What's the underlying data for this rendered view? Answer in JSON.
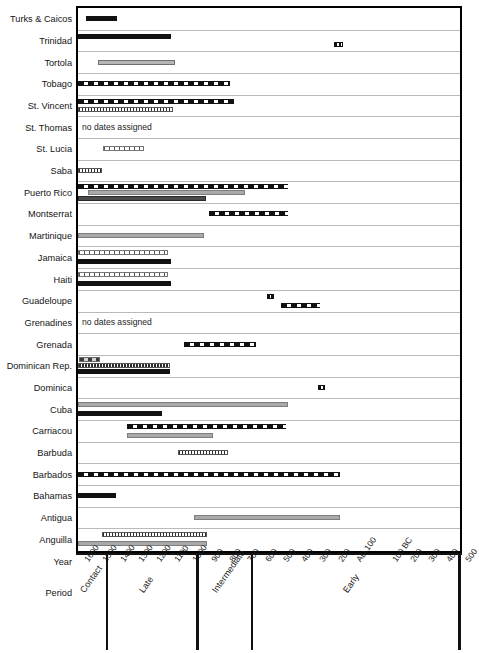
{
  "chart_data": {
    "type": "bar",
    "chart_kind": "horizontal-range-bar-timeline",
    "title": "",
    "xlabel": "Year",
    "ylabel": "",
    "grid": true,
    "legend": false,
    "x_axis": {
      "name": "Year",
      "direction": "decreasing-left-to-right (AD years then BC)",
      "ticks": [
        "1600",
        "1500",
        "1400",
        "1300",
        "1200",
        "1100",
        "1000",
        "900",
        "800",
        "700",
        "600",
        "500",
        "400",
        "300",
        "200",
        "AD 100",
        "100 BC",
        "200",
        "300",
        "400",
        "500"
      ],
      "xlim_label_left": "1600",
      "xlim_label_right": "500"
    },
    "period_axis": {
      "name": "Period",
      "periods": [
        "Contact",
        "Late",
        "Intermediate",
        "Early"
      ]
    },
    "no_data_note": "no dates assigned",
    "categories": [
      "Turks & Caicos",
      "Trinidad",
      "Tortola",
      "Tobago",
      "St. Vincent",
      "St. Thomas",
      "St. Lucia",
      "Saba",
      "Puerto Rico",
      "Montserrat",
      "Martinique",
      "Jamaica",
      "Haiti",
      "Guadeloupe",
      "Grenadines",
      "Grenada",
      "Dominican Rep.",
      "Dominica",
      "Cuba",
      "Carriacou",
      "Barbuda",
      "Barbados",
      "Bahamas",
      "Antigua",
      "Anguilla"
    ],
    "rows": [
      {
        "label": "Turks & Caicos",
        "no_dates": false,
        "bars": [
          {
            "start": 1555,
            "end": 1385,
            "style": "solid-black"
          }
        ]
      },
      {
        "label": "Trinidad",
        "no_dates": false,
        "bars": [
          {
            "start": 1600,
            "end": 1090,
            "style": "solid-black"
          },
          {
            "start": 190,
            "end": 140,
            "style": "marker"
          }
        ]
      },
      {
        "label": "Tortola",
        "no_dates": false,
        "bars": [
          {
            "start": 1490,
            "end": 1065,
            "style": "grey-fill"
          }
        ]
      },
      {
        "label": "Tobago",
        "no_dates": false,
        "bars": [
          {
            "start": 1600,
            "end": 760,
            "style": "dash-big"
          }
        ]
      },
      {
        "label": "St. Vincent",
        "no_dates": false,
        "bars": [
          {
            "start": 1600,
            "end": 740,
            "style": "dash-big"
          },
          {
            "start": 1600,
            "end": 1075,
            "style": "speckle"
          }
        ]
      },
      {
        "label": "St. Thomas",
        "no_dates": true,
        "bars": []
      },
      {
        "label": "St. Lucia",
        "no_dates": false,
        "bars": [
          {
            "start": 1460,
            "end": 1235,
            "style": "hatch-fine"
          }
        ]
      },
      {
        "label": "Saba",
        "no_dates": false,
        "bars": [
          {
            "start": 1600,
            "end": 1470,
            "style": "speckle"
          }
        ]
      },
      {
        "label": "Puerto Rico",
        "no_dates": false,
        "bars": [
          {
            "start": 1600,
            "end": 440,
            "style": "dash-big"
          },
          {
            "start": 1545,
            "end": 680,
            "style": "grey-plain"
          },
          {
            "start": 1600,
            "end": 895,
            "style": "dark-grey"
          }
        ]
      },
      {
        "label": "Montserrat",
        "no_dates": false,
        "bars": [
          {
            "start": 880,
            "end": 440,
            "style": "dash-big"
          }
        ]
      },
      {
        "label": "Martinique",
        "no_dates": false,
        "bars": [
          {
            "start": 1600,
            "end": 905,
            "style": "grey-plain"
          }
        ]
      },
      {
        "label": "Jamaica",
        "no_dates": false,
        "bars": [
          {
            "start": 1600,
            "end": 1105,
            "style": "hatch-fine"
          },
          {
            "start": 1600,
            "end": 1085,
            "style": "solid-black"
          }
        ]
      },
      {
        "label": "Haiti",
        "no_dates": false,
        "bars": [
          {
            "start": 1600,
            "end": 1105,
            "style": "hatch-fine"
          },
          {
            "start": 1600,
            "end": 1085,
            "style": "solid-black"
          }
        ]
      },
      {
        "label": "Guadeloupe",
        "no_dates": false,
        "bars": [
          {
            "start": 560,
            "end": 520,
            "style": "marker"
          },
          {
            "start": 480,
            "end": 265,
            "style": "dash-big"
          }
        ]
      },
      {
        "label": "Grenadines",
        "no_dates": true,
        "bars": []
      },
      {
        "label": "Grenada",
        "no_dates": false,
        "bars": [
          {
            "start": 1015,
            "end": 620,
            "style": "dash-big"
          }
        ]
      },
      {
        "label": "Dominican Rep.",
        "no_dates": false,
        "bars": [
          {
            "start": 1595,
            "end": 1480,
            "style": "dash-grey"
          },
          {
            "start": 1600,
            "end": 1095,
            "style": "speckle"
          },
          {
            "start": 1600,
            "end": 1095,
            "style": "solid-black"
          }
        ]
      },
      {
        "label": "Dominica",
        "no_dates": false,
        "bars": [
          {
            "start": 275,
            "end": 240,
            "style": "marker"
          }
        ]
      },
      {
        "label": "Cuba",
        "no_dates": false,
        "bars": [
          {
            "start": 1600,
            "end": 445,
            "style": "grey-plain"
          },
          {
            "start": 1600,
            "end": 1135,
            "style": "solid-black"
          }
        ]
      },
      {
        "label": "Carriacou",
        "no_dates": false,
        "bars": [
          {
            "start": 1330,
            "end": 455,
            "style": "dash-big"
          },
          {
            "start": 1330,
            "end": 855,
            "style": "grey-plain"
          }
        ]
      },
      {
        "label": "Barbuda",
        "no_dates": false,
        "bars": [
          {
            "start": 1050,
            "end": 775,
            "style": "speckle"
          }
        ]
      },
      {
        "label": "Barbados",
        "no_dates": false,
        "bars": [
          {
            "start": 1600,
            "end": 155,
            "style": "dash-big"
          }
        ]
      },
      {
        "label": "Bahamas",
        "no_dates": false,
        "bars": [
          {
            "start": 1600,
            "end": 1390,
            "style": "solid-black"
          }
        ]
      },
      {
        "label": "Antigua",
        "no_dates": false,
        "bars": [
          {
            "start": 960,
            "end": 155,
            "style": "grey-plain"
          }
        ]
      },
      {
        "label": "Anguilla",
        "no_dates": false,
        "bars": [
          {
            "start": 1470,
            "end": 890,
            "style": "speckle"
          },
          {
            "start": 1600,
            "end": 890,
            "style": "grey-plain"
          }
        ]
      }
    ]
  }
}
